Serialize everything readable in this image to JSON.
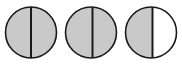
{
  "figure": {
    "name": "bisected-circles-diagram",
    "width": 182,
    "height": 66,
    "background_color": "#ffffff",
    "outline_color": "#1a1a1a",
    "outline_width": 1.6,
    "divider_color": "#1a1a1a",
    "divider_width": 2.0,
    "fill_gray": "#c9c9c9",
    "fill_white": "#ffffff",
    "circle_count": 3,
    "circles": [
      {
        "id": "circle-1",
        "label": "Circle 1",
        "cx": 31,
        "cy": 32.5,
        "r": 25.5,
        "divider_x": 31,
        "left_fill": "#c9c9c9",
        "right_fill": "#c9c9c9",
        "shading": "full"
      },
      {
        "id": "circle-2",
        "label": "Circle 2",
        "cx": 91,
        "cy": 32.5,
        "r": 25.5,
        "divider_x": 92.5,
        "left_fill": "#c9c9c9",
        "right_fill": "#c9c9c9",
        "shading": "full"
      },
      {
        "id": "circle-3",
        "label": "Circle 3",
        "cx": 151,
        "cy": 32.5,
        "r": 25.5,
        "divider_x": 152.5,
        "left_fill": "#c9c9c9",
        "right_fill": "#ffffff",
        "shading": "left-half"
      }
    ]
  }
}
